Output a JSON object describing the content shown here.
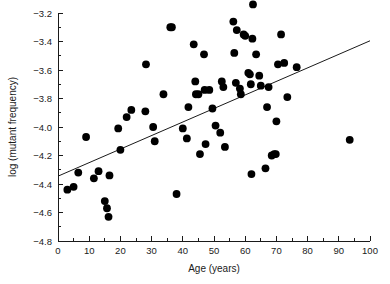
{
  "chart_data": {
    "type": "scatter",
    "title": "",
    "xlabel": "Age (years)",
    "ylabel": "log (mutant frequency)",
    "xlim": [
      0,
      100
    ],
    "ylim": [
      -4.8,
      -3.2
    ],
    "xticks": [
      0,
      10,
      20,
      30,
      40,
      50,
      60,
      70,
      80,
      90,
      100
    ],
    "xtick_labels": [
      "0",
      "10",
      "20",
      "30",
      "40",
      "50",
      "60",
      "70",
      "80",
      "90",
      "100"
    ],
    "xtick_minor_step": 5,
    "yticks": [
      -3.2,
      -3.4,
      -3.6,
      -3.8,
      -4.0,
      -4.2,
      -4.4,
      -4.6,
      -4.8
    ],
    "ytick_labels": [
      "−3.2",
      "−3.4",
      "−3.6",
      "−3.8",
      "−4.0",
      "−4.2",
      "−4.4",
      "−4.6",
      "−4.8"
    ],
    "ytick_minor_step": 0.1,
    "grid": false,
    "legend": null,
    "marker": {
      "shape": "circle",
      "color": "#000000",
      "size_px": 4.6
    },
    "trendline": {
      "kind": "linear-regression",
      "color": "#1a1a1a",
      "x_start": 0,
      "y_start": -4.345,
      "x_end": 100,
      "y_end": -3.395,
      "slope_per_year": 0.0095,
      "intercept": -4.345
    },
    "series": [
      {
        "name": "samples",
        "n": 70,
        "points": [
          [
            3.0,
            -4.44
          ],
          [
            5.0,
            -4.42
          ],
          [
            6.5,
            -4.32
          ],
          [
            9.0,
            -4.07
          ],
          [
            11.5,
            -4.36
          ],
          [
            13.0,
            -4.31
          ],
          [
            15.0,
            -4.52
          ],
          [
            15.7,
            -4.57
          ],
          [
            16.2,
            -4.63
          ],
          [
            16.5,
            -4.34
          ],
          [
            19.3,
            -4.01
          ],
          [
            20.0,
            -4.16
          ],
          [
            22.0,
            -3.93
          ],
          [
            23.5,
            -3.88
          ],
          [
            28.0,
            -3.89
          ],
          [
            28.2,
            -3.56
          ],
          [
            30.5,
            -4.0
          ],
          [
            31.0,
            -4.1
          ],
          [
            33.8,
            -3.77
          ],
          [
            36.0,
            -3.3
          ],
          [
            38.0,
            -4.47
          ],
          [
            40.0,
            -4.01
          ],
          [
            41.3,
            -4.08
          ],
          [
            41.8,
            -3.86
          ],
          [
            43.5,
            -3.42
          ],
          [
            44.0,
            -3.68
          ],
          [
            44.2,
            -3.77
          ],
          [
            45.5,
            -4.19
          ],
          [
            46.8,
            -3.49
          ],
          [
            47.0,
            -3.74
          ],
          [
            47.3,
            -4.12
          ],
          [
            49.5,
            -3.87
          ],
          [
            50.5,
            -3.99
          ],
          [
            52.0,
            -4.04
          ],
          [
            52.5,
            -3.68
          ],
          [
            53.0,
            -3.72
          ],
          [
            53.5,
            -4.14
          ],
          [
            56.2,
            -3.26
          ],
          [
            56.5,
            -3.48
          ],
          [
            57.3,
            -3.32
          ],
          [
            58.3,
            -3.73
          ],
          [
            58.6,
            -3.77
          ],
          [
            59.5,
            -3.35
          ],
          [
            60.0,
            -3.36
          ],
          [
            61.0,
            -3.62
          ],
          [
            61.5,
            -3.63
          ],
          [
            61.8,
            -3.7
          ],
          [
            62.0,
            -4.33
          ],
          [
            62.3,
            -3.38
          ],
          [
            62.5,
            -3.14
          ],
          [
            63.5,
            -3.49
          ],
          [
            64.5,
            -3.64
          ],
          [
            65.0,
            -3.71
          ],
          [
            66.5,
            -4.29
          ],
          [
            67.0,
            -3.86
          ],
          [
            67.5,
            -3.72
          ],
          [
            68.5,
            -4.2
          ],
          [
            69.3,
            -4.19
          ],
          [
            69.8,
            -4.19
          ],
          [
            70.0,
            -3.96
          ],
          [
            70.5,
            -3.56
          ],
          [
            71.5,
            -3.35
          ],
          [
            72.5,
            -3.55
          ],
          [
            73.5,
            -3.79
          ],
          [
            76.5,
            -3.58
          ],
          [
            57.0,
            -3.69
          ],
          [
            45.0,
            -3.77
          ],
          [
            48.5,
            -3.74
          ],
          [
            36.5,
            -3.3
          ],
          [
            93.5,
            -4.09
          ]
        ]
      }
    ]
  }
}
